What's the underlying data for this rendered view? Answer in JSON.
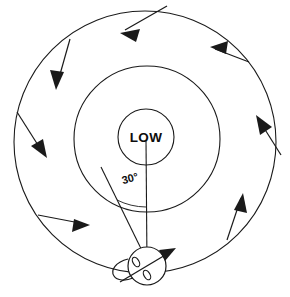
{
  "figure": {
    "type": "meteorological-diagram",
    "background_color": "#ffffff",
    "stroke_color": "#1a1a1a",
    "labels": {
      "center": "LOW",
      "angle": "30°"
    },
    "center_point": {
      "cx": 146,
      "cy": 137
    },
    "isobars": [
      {
        "name": "inner-isobar",
        "cx": 146,
        "cy": 137,
        "r": 28,
        "stroke_width": 1.1
      },
      {
        "name": "middle-isobar",
        "cx": 147,
        "cy": 139,
        "r": 73,
        "stroke_width": 1.1
      },
      {
        "name": "outer-isobar",
        "cx": 145,
        "cy": 142,
        "r": 131,
        "stroke_width": 1.1
      }
    ],
    "radial_line": {
      "name": "radius-to-station",
      "x1": 146,
      "y1": 137,
      "x2": 147,
      "y2": 265,
      "stroke_width": 1.1
    },
    "wind_direction_line": {
      "name": "wind-vector-at-station",
      "x1": 101,
      "y1": 168,
      "x2": 150,
      "y2": 268,
      "stroke_width": 1.1
    },
    "angle_arc": {
      "name": "angle-arc-30deg",
      "description": "arc between radial line and surface wind direction",
      "value_degrees": 30
    },
    "station_model": {
      "name": "station-circle",
      "cx": 147,
      "cy": 266,
      "r": 19,
      "barb": {
        "x1": 122,
        "y1": 281,
        "x2": 176,
        "y2": 249
      },
      "flag_count": 2,
      "description": "station plot with wind barb and two pennants"
    },
    "wind_arrows": [
      {
        "name": "wind-arrow-n",
        "x": 145,
        "y": 12,
        "angle_deg": 196,
        "length": 46,
        "crossing": "outer"
      },
      {
        "name": "wind-arrow-nw",
        "x": 62,
        "y": 47,
        "angle_deg": 117,
        "length": 44,
        "crossing": "outer"
      },
      {
        "name": "wind-arrow-w",
        "x": 20,
        "y": 132,
        "angle_deg": 62,
        "length": 44,
        "crossing": "outer"
      },
      {
        "name": "wind-arrow-sw",
        "x": 50,
        "y": 218,
        "angle_deg": 13,
        "length": 46,
        "crossing": "outer"
      },
      {
        "name": "wind-arrow-se",
        "x": 230,
        "y": 222,
        "angle_deg": 289,
        "length": 46,
        "crossing": "outer"
      },
      {
        "name": "wind-arrow-e",
        "x": 265,
        "y": 133,
        "angle_deg": 241,
        "length": 44,
        "crossing": "outer"
      },
      {
        "name": "wind-arrow-ne",
        "x": 228,
        "y": 50,
        "angle_deg": 200,
        "length": 46,
        "crossing": "outer"
      }
    ],
    "reading": {
      "circulation_sense": "counterclockwise",
      "inflow": "air crosses the isobars inward toward the low",
      "cross_isobar_angle": "30°"
    }
  }
}
